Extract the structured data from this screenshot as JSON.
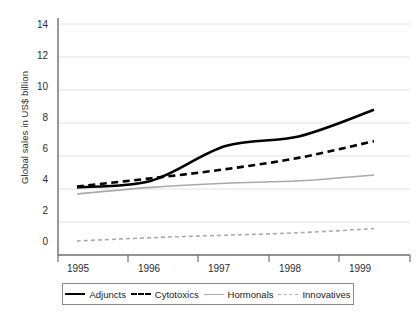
{
  "chart_data": {
    "type": "line",
    "title": "",
    "subtitle": "",
    "xlabel": "",
    "ylabel": "Global sales in US$ billion",
    "categories": [
      "1995",
      "1996",
      "1997",
      "1998",
      "1999"
    ],
    "x": [
      1995,
      1996,
      1997,
      1998,
      1999
    ],
    "xlim": [
      1995,
      1999.6
    ],
    "ylim": [
      0,
      14
    ],
    "yticks": [
      0,
      2,
      4,
      6,
      8,
      10,
      12,
      14
    ],
    "xticks": [
      "1995",
      "1996",
      "1997",
      "1998",
      "1999"
    ],
    "grid": "horizontal",
    "legend_position": "bottom",
    "series": [
      {
        "name": "Adjuncts",
        "values": [
          4.1,
          4.5,
          6.6,
          7.2,
          8.8
        ],
        "color": "#000000",
        "style": "solid",
        "width": 2.6
      },
      {
        "name": "Cytotoxics",
        "values": [
          4.15,
          4.65,
          5.2,
          5.9,
          6.9
        ],
        "color": "#000000",
        "style": "dashed",
        "width": 2.6
      },
      {
        "name": "Hormonals",
        "values": [
          3.7,
          4.1,
          4.35,
          4.5,
          4.85
        ],
        "color": "#aaaaaa",
        "style": "solid",
        "width": 1.6
      },
      {
        "name": "Innovatives",
        "values": [
          0.85,
          1.05,
          1.2,
          1.35,
          1.6
        ],
        "color": "#aaaaaa",
        "style": "dashed",
        "width": 1.6
      }
    ]
  },
  "axis": {
    "y_tick_labels": [
      "14",
      "12",
      "10",
      "8",
      "6",
      "4",
      "2",
      "0"
    ],
    "x_tick_labels": [
      "1995",
      "1996",
      "1997",
      "1998",
      "1999"
    ],
    "y_axis_title": "Global sales in US$ billion"
  },
  "legend": {
    "entries": [
      {
        "label": "Adjuncts"
      },
      {
        "label": "Cytotoxics"
      },
      {
        "label": "Hormonals"
      },
      {
        "label": "Innovatives"
      }
    ]
  }
}
